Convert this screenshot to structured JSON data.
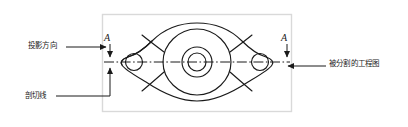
{
  "figure": {
    "type": "engineering-drawing-annotation",
    "canvas": {
      "width": 408,
      "height": 127,
      "background": "#ffffff"
    },
    "frame": {
      "name": "drawing-frame",
      "x": 102,
      "y": 14,
      "width": 190,
      "height": 98,
      "border_color": "#d9d9d9",
      "fill": "#ffffff"
    },
    "line_color": "#1a1a1a",
    "annotations": [
      {
        "id": "projection-direction",
        "text": "投影方向",
        "position": "left",
        "leader": "horizontal-right-arrow"
      },
      {
        "id": "section-line",
        "text": "剖切线",
        "position": "bottom-left",
        "leader": "elbow-up-arrow"
      },
      {
        "id": "split-drawing",
        "text": "被分割的工程图",
        "position": "right",
        "leader": "horizontal-left-arrow"
      }
    ],
    "section_marks": [
      {
        "id": "section-mark-left",
        "letter": "A",
        "x": 108,
        "y": 40,
        "arrow": "down"
      },
      {
        "id": "section-mark-right",
        "letter": "A",
        "x": 285,
        "y": 40,
        "arrow": "down"
      }
    ],
    "cut_line": {
      "name": "section-cut-line",
      "style": "dash-dot",
      "y": 62,
      "x_start": 104,
      "x_end": 290
    },
    "part": {
      "name": "flanged-bearing-housing",
      "center": {
        "x": 197,
        "y": 62
      },
      "center_circles_r": [
        15,
        9
      ],
      "lobe_left": {
        "cx": 134,
        "cy": 62,
        "r": 8.5
      },
      "lobe_right": {
        "cx": 260,
        "cy": 62,
        "r": 8.5
      },
      "body_r": 33
    }
  }
}
